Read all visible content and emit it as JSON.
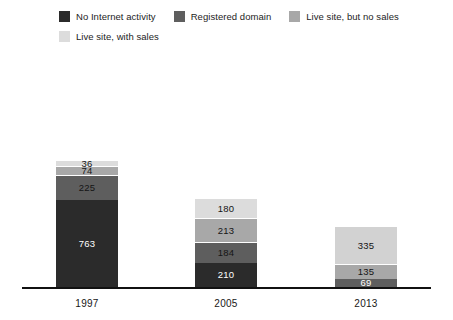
{
  "legend": {
    "rows": [
      [
        {
          "label": "No Internet activity",
          "color": "#2b2b2b",
          "swatch_name": "legend-swatch-no-internet-activity"
        },
        {
          "label": "Registered domain",
          "color": "#5e5e5e",
          "swatch_name": "legend-swatch-registered-domain"
        },
        {
          "label": "Live site, but no sales",
          "color": "#a8a8a8",
          "swatch_name": "legend-swatch-live-site-no-sales"
        }
      ],
      [
        {
          "label": "Live site, with sales",
          "color": "#dcdcdc",
          "swatch_name": "legend-swatch-live-site-with-sales"
        }
      ]
    ]
  },
  "chart_data": {
    "type": "bar",
    "subtype": "stacked",
    "title": "",
    "xlabel": "",
    "ylabel": "",
    "grid": false,
    "legend_position": "top-left",
    "axis_color": "#111111",
    "categories": [
      "1997",
      "2005",
      "2013"
    ],
    "series": [
      {
        "name": "No Internet activity",
        "color": "#2b2b2b",
        "text_color": "#ffffff",
        "values": [
          763,
          210,
          69
        ]
      },
      {
        "name": "Registered domain",
        "color": "#5e5e5e",
        "text_color": "#141414",
        "values": [
          225,
          184,
          135
        ]
      },
      {
        "name": "Live site, but no sales",
        "color": "#a8a8a8",
        "text_color": "#141414",
        "values": [
          74,
          213,
          335
        ]
      },
      {
        "name": "Live site, with sales",
        "color": "#dcdcdc",
        "text_color": "#141414",
        "values": [
          36,
          180,
          0
        ]
      }
    ],
    "totals": [
      1098,
      787,
      539
    ],
    "bars": [
      {
        "category": "1997",
        "left": 56,
        "segments": [
          {
            "series": "No Internet activity",
            "value": 763,
            "value_text": "763",
            "color": "#2b2b2b",
            "text_color": "#ffffff"
          },
          {
            "series": "Registered domain",
            "value": 225,
            "value_text": "225",
            "color": "#5e5e5e",
            "text_color": "#151515"
          },
          {
            "series": "Live site, but no sales",
            "value": 74,
            "value_text": "74",
            "color": "#a8a8a8",
            "text_color": "#151515"
          },
          {
            "series": "Live site, with sales",
            "value": 36,
            "value_text": "36",
            "color": "#dcdcdc",
            "text_color": "#151515"
          }
        ]
      },
      {
        "category": "2005",
        "left": 195,
        "segments": [
          {
            "series": "No Internet activity",
            "value": 210,
            "value_text": "210",
            "color": "#2b2b2b",
            "text_color": "#ffffff"
          },
          {
            "series": "Registered domain",
            "value": 184,
            "value_text": "184",
            "color": "#5e5e5e",
            "text_color": "#151515"
          },
          {
            "series": "Live site, but no sales",
            "value": 213,
            "value_text": "213",
            "color": "#a8a8a8",
            "text_color": "#151515"
          },
          {
            "series": "Live site, with sales",
            "value": 180,
            "value_text": "180",
            "color": "#dcdcdc",
            "text_color": "#151515"
          }
        ]
      },
      {
        "category": "2013",
        "left": 335,
        "segments": [
          {
            "series": "No Internet activity",
            "value": 69,
            "value_text": "69",
            "color": "#5e5e5e",
            "text_color": "#ffffff"
          },
          {
            "series": "Registered domain",
            "value": 135,
            "value_text": "135",
            "color": "#a8a8a8",
            "text_color": "#151515"
          },
          {
            "series": "Live site, but no sales",
            "value": 335,
            "value_text": "335",
            "color": "#d2d2d2",
            "text_color": "#151515"
          }
        ]
      }
    ],
    "scale_px_per_unit": 0.1135,
    "bar_width_px": 62,
    "baseline_y_px": 287
  }
}
